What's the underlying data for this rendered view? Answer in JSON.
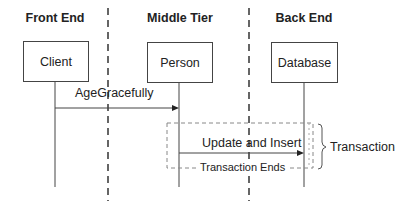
{
  "diagram": {
    "type": "sequence",
    "tiers": [
      {
        "label": "Front End",
        "x": 55
      },
      {
        "label": "Middle Tier",
        "x": 179
      },
      {
        "label": "Back End",
        "x": 304
      }
    ],
    "participants": [
      {
        "label": "Client"
      },
      {
        "label": "Person"
      },
      {
        "label": "Database"
      }
    ],
    "messages": [
      {
        "label": "AgeGracefully",
        "from": "Client",
        "to": "Person"
      },
      {
        "label": "Update and Insert",
        "from": "Person",
        "to": "Database"
      }
    ],
    "transaction": {
      "end_label": "Transaction Ends",
      "brace_label": "Transaction"
    },
    "colors": {
      "line": "#444444",
      "dash": "#888888",
      "separator": "#333333"
    }
  }
}
